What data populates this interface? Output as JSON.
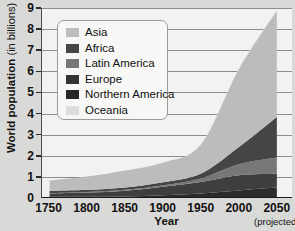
{
  "chart_data": {
    "type": "area",
    "stacked": true,
    "title": "",
    "xlabel": "Year",
    "ylabel": "World population (in billions)",
    "ylabel_main": "World population",
    "ylabel_unit": "(in billions)",
    "xlim": [
      1740,
      2070
    ],
    "ylim": [
      0,
      9
    ],
    "grid": true,
    "legend_position": "top-left-inset",
    "y_ticks": [
      0,
      1,
      2,
      3,
      4,
      5,
      6,
      7,
      8,
      9
    ],
    "y_tick_labels": [
      "0",
      "1",
      "2",
      "3",
      "4",
      "5",
      "6",
      "7",
      "8",
      "9"
    ],
    "x_ticks": [
      1750,
      1800,
      1850,
      1900,
      1950,
      2000,
      2050
    ],
    "x_tick_labels": [
      "1750",
      "1800",
      "1850",
      "1900",
      "1950",
      "2000",
      "2050"
    ],
    "x_tick_annotation": {
      "at": 2050,
      "text": "(projected)"
    },
    "x": [
      1750,
      1800,
      1850,
      1900,
      1950,
      2000,
      2050
    ],
    "series": [
      {
        "name": "Northern America",
        "color": "#2b2b2b",
        "values": [
          0.002,
          0.007,
          0.026,
          0.082,
          0.172,
          0.314,
          0.448
        ]
      },
      {
        "name": "Europe",
        "color": "#3e3e3e",
        "values": [
          0.163,
          0.203,
          0.276,
          0.408,
          0.547,
          0.727,
          0.664
        ]
      },
      {
        "name": "Latin America",
        "color": "#777775",
        "values": [
          0.016,
          0.024,
          0.038,
          0.074,
          0.167,
          0.521,
          0.769
        ]
      },
      {
        "name": "Africa",
        "color": "#454545",
        "values": [
          0.106,
          0.107,
          0.111,
          0.133,
          0.228,
          0.819,
          1.932
        ]
      },
      {
        "name": "Asia",
        "color": "#bcbcba",
        "values": [
          0.502,
          0.635,
          0.809,
          0.947,
          1.402,
          3.719,
          5.061
        ]
      },
      {
        "name": "Oceania",
        "color": "#e2e2e0",
        "values": [
          0.002,
          0.002,
          0.002,
          0.006,
          0.013,
          0.031,
          0.046
        ]
      }
    ],
    "legend_entries": [
      {
        "label": "Asia",
        "color": "#bcbcba"
      },
      {
        "label": "Africa",
        "color": "#454545"
      },
      {
        "label": "Latin America",
        "color": "#777775"
      },
      {
        "label": "Europe",
        "color": "#333333"
      },
      {
        "label": "Northern America",
        "color": "#262626"
      },
      {
        "label": "Oceania",
        "color": "#dcdcda"
      }
    ]
  }
}
